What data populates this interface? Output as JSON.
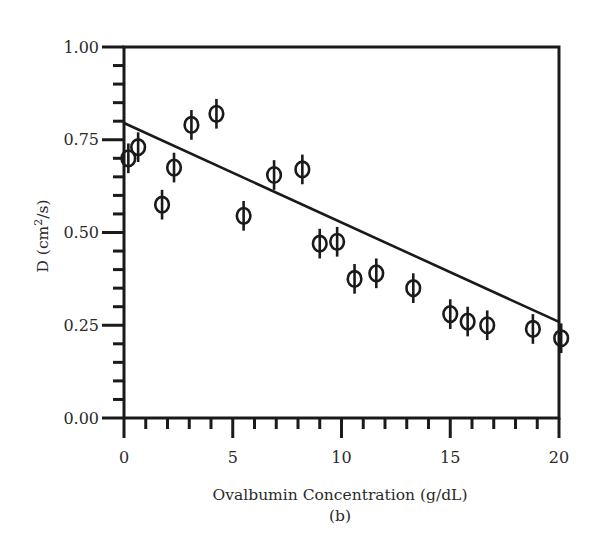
{
  "chart_data": {
    "type": "scatter",
    "title": "",
    "caption": "(b)",
    "xlabel": "Ovalbumin Concentration (g/dL)",
    "ylabel_main": "D (cm",
    "ylabel_sup": "2",
    "ylabel_tail": "/s)",
    "ylabel": "D (cm²/s)",
    "xlim": [
      0,
      20
    ],
    "ylim": [
      0.0,
      1.0
    ],
    "grid": false,
    "legend": "none",
    "x_major_ticks": [
      0,
      5,
      10,
      15,
      20
    ],
    "x_tick_labels": [
      "0",
      "5",
      "10",
      "15",
      "20"
    ],
    "x_minor_step": 1,
    "y_major_ticks": [
      0.0,
      0.25,
      0.5,
      0.75,
      1.0
    ],
    "y_tick_labels": [
      "0.00",
      "0.25",
      "0.50",
      "0.75",
      "1.00"
    ],
    "y_minor_step": 0.05,
    "series": [
      {
        "name": "measured D",
        "marker": "circle-with-error-bar",
        "x": [
          0.2,
          0.65,
          1.75,
          2.3,
          3.1,
          4.25,
          5.5,
          6.9,
          8.2,
          9.0,
          9.8,
          10.6,
          11.6,
          13.3,
          15.0,
          15.8,
          16.7,
          18.8,
          20.1
        ],
        "y": [
          0.7,
          0.73,
          0.575,
          0.675,
          0.79,
          0.82,
          0.545,
          0.655,
          0.67,
          0.47,
          0.475,
          0.375,
          0.39,
          0.35,
          0.28,
          0.26,
          0.25,
          0.24,
          0.215
        ],
        "error": 0.04
      }
    ],
    "fit_line": {
      "name": "linear fit",
      "x": [
        0,
        20
      ],
      "y": [
        0.795,
        0.259
      ]
    }
  }
}
